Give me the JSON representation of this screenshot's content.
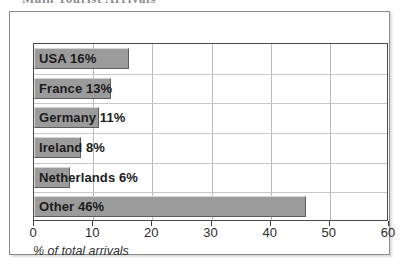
{
  "heading": {
    "clipped_text": "Main Tourist Arrivals"
  },
  "chart_data": {
    "type": "bar",
    "orientation": "horizontal",
    "title": "",
    "xlabel": "% of total arrivals",
    "ylabel": "",
    "categories": [
      "USA",
      "France",
      "Germany",
      "Ireland",
      "Netherlands",
      "Other"
    ],
    "values": [
      16,
      13,
      11,
      8,
      6,
      46
    ],
    "value_suffix": "%",
    "bar_labels": [
      "USA 16%",
      "France 13%",
      "Germany 11%",
      "Ireland 8%",
      "Netherlands 6%",
      "Other 46%"
    ],
    "xlim": [
      0,
      60
    ],
    "xticks": [
      0,
      10,
      20,
      30,
      40,
      50,
      60
    ],
    "xtick_labels": [
      "0",
      "10",
      "20",
      "30",
      "40",
      "50",
      "60"
    ],
    "grid": true,
    "legend": null,
    "bar_color": "#9b9b9b",
    "bar_border_color": "#5d5d5d",
    "grid_color": "#b9b9b9",
    "axis_color": "#4a4a4a"
  }
}
